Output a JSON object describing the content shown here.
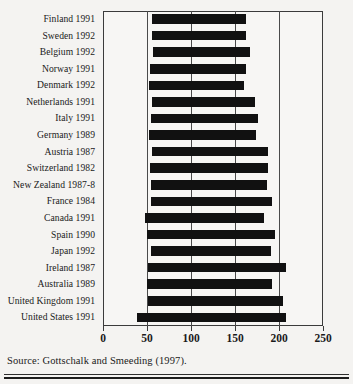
{
  "figure": {
    "source_note": "Source: Gottschalk and Smeeding (1997).",
    "bar_color": "#111111",
    "axis_color": "#3b3b3b",
    "background_color": "#f4f3f1"
  },
  "chart_data": {
    "type": "bar",
    "orientation": "horizontal",
    "title": "",
    "subtitle": "",
    "xlabel": "",
    "ylabel": "",
    "xlim": [
      0,
      250
    ],
    "ylim": null,
    "grid": true,
    "grid_axis": "x",
    "legend": false,
    "legend_position": "none",
    "xticks": [
      0,
      50,
      100,
      150,
      200,
      250
    ],
    "xticklabels": [
      "0",
      "50",
      "100",
      "150",
      "200",
      "250"
    ],
    "note": "Horizontal floating bars: each country spans from a low percentile income value to a high percentile income value.",
    "categories": [
      "Finland 1991",
      "Sweden 1992",
      "Belgium 1992",
      "Norway 1991",
      "Denmark 1992",
      "Netherlands 1991",
      "Italy 1991",
      "Germany 1989",
      "Austria 1987",
      "Switzerland 1982",
      "New Zealand 1987-8",
      "France 1984",
      "Canada 1991",
      "Spain 1990",
      "Japan 1992",
      "Ireland 1987",
      "Australia 1989",
      "United Kingdom 1991",
      "United States 1991"
    ],
    "bars": [
      {
        "category": "Finland 1991",
        "start": 56,
        "end": 162,
        "width": 106
      },
      {
        "category": "Sweden 1992",
        "start": 56,
        "end": 162,
        "width": 106
      },
      {
        "category": "Belgium 1992",
        "start": 57,
        "end": 167,
        "width": 110
      },
      {
        "category": "Norway 1991",
        "start": 53,
        "end": 162,
        "width": 109
      },
      {
        "category": "Denmark 1992",
        "start": 52,
        "end": 160,
        "width": 108
      },
      {
        "category": "Netherlands 1991",
        "start": 56,
        "end": 173,
        "width": 117
      },
      {
        "category": "Italy 1991",
        "start": 54,
        "end": 176,
        "width": 122
      },
      {
        "category": "Germany 1989",
        "start": 52,
        "end": 174,
        "width": 122
      },
      {
        "category": "Austria 1987",
        "start": 56,
        "end": 187,
        "width": 131
      },
      {
        "category": "Switzerland 1982",
        "start": 53,
        "end": 187,
        "width": 134
      },
      {
        "category": "New Zealand 1987-8",
        "start": 54,
        "end": 186,
        "width": 132
      },
      {
        "category": "France 1984",
        "start": 55,
        "end": 192,
        "width": 137
      },
      {
        "category": "Canada 1991",
        "start": 48,
        "end": 183,
        "width": 135
      },
      {
        "category": "Spain 1990",
        "start": 50,
        "end": 196,
        "width": 146
      },
      {
        "category": "Japan 1992",
        "start": 54,
        "end": 191,
        "width": 137
      },
      {
        "category": "Ireland 1987",
        "start": 51,
        "end": 208,
        "width": 157
      },
      {
        "category": "Australia 1989",
        "start": 50,
        "end": 192,
        "width": 142
      },
      {
        "category": "United Kingdom 1991",
        "start": 51,
        "end": 205,
        "width": 154
      },
      {
        "category": "United States 1991",
        "start": 39,
        "end": 208,
        "width": 169
      }
    ]
  }
}
